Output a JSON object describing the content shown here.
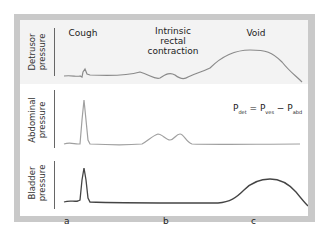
{
  "figure": {
    "panels": [
      {
        "id": "detrusor",
        "label": "Detrusor\npressure",
        "line_color": "#8a8a8a"
      },
      {
        "id": "abdominal",
        "label": "Abdominal\npressure",
        "line_color": "#a0a0a0"
      },
      {
        "id": "bladder",
        "label": "Bladder\npressure",
        "line_color": "#444444"
      }
    ],
    "event_titles": {
      "cough": "Cough",
      "intrinsic": "Intrinsic\nrectal\ncontraction",
      "void": "Void"
    },
    "x_labels": {
      "a": "a",
      "b": "b",
      "c": "c"
    },
    "formula": {
      "lhs_main": "P",
      "lhs_sub": "det",
      "eq": " = ",
      "t1_main": "P",
      "t1_sub": "ves",
      "minus": " − ",
      "t2_main": "P",
      "t2_sub": "abd"
    },
    "colors": {
      "frame": "#c9c9c9",
      "detrusor_bg": "#f3f3f3",
      "panel_bg": "#ffffff"
    }
  }
}
